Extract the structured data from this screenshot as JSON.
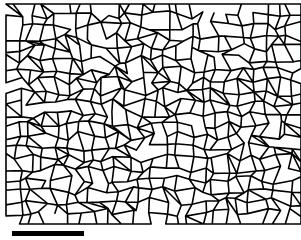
{
  "image": {
    "type": "grain-boundary-micrograph",
    "background_color": "#ffffff",
    "boundary_color": "#000000",
    "network_region": {
      "x": 6,
      "y": 4,
      "width": 295,
      "height": 220
    },
    "grid": {
      "cols": 24,
      "rows": 20,
      "jitter": 0.42,
      "seed": 7
    },
    "stroke_width": 1.6
  },
  "scale_bar": {
    "x": 12,
    "y": 231,
    "width": 72,
    "height": 5,
    "color": "#000000",
    "label": ""
  }
}
